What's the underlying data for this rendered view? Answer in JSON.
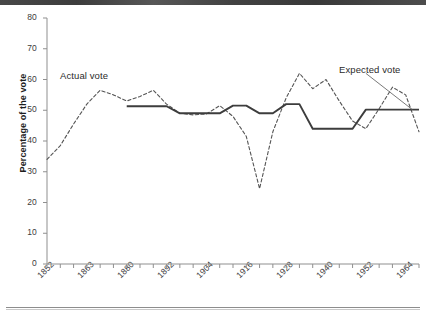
{
  "chart_data": {
    "type": "line",
    "title": "",
    "subtitle": "",
    "xlabel": "",
    "ylabel": "Percentage of the vote",
    "xlim": [
      1852,
      1964
    ],
    "ylim": [
      0,
      80
    ],
    "grid": false,
    "legend_position": "inline-annotation",
    "y_ticks": [
      0,
      10,
      20,
      30,
      40,
      50,
      60,
      70,
      80
    ],
    "y_tick_labels": [
      "0",
      "10",
      "20",
      "30",
      "40",
      "50",
      "60",
      "70",
      "80"
    ],
    "x_tick_step_years": 4,
    "x_label_step_years": 12,
    "x_ticks": [
      1852,
      1856,
      1860,
      1864,
      1868,
      1872,
      1876,
      1880,
      1884,
      1888,
      1892,
      1896,
      1900,
      1904,
      1908,
      1912,
      1916,
      1920,
      1924,
      1928,
      1932,
      1936,
      1940,
      1944,
      1948,
      1952,
      1956,
      1960,
      1964
    ],
    "x_tick_labels": [
      "1852",
      "1864",
      "1876",
      "1888",
      "1900",
      "1912",
      "1924",
      "1936",
      "1948",
      "1960"
    ],
    "x_labels_shown": [
      "1852",
      "1863",
      "1880",
      "1892",
      "1904",
      "1916",
      "1928",
      "1940",
      "1952",
      "1964"
    ],
    "annotations": [
      {
        "name": "actual-vote-label",
        "text": "Actual vote",
        "x": 1856,
        "y": 62
      },
      {
        "name": "expected-vote-label",
        "text": "Expected vote",
        "x": 1948,
        "y": 64
      }
    ],
    "series": [
      {
        "name": "Actual vote",
        "style": "dashed",
        "color": "#555555",
        "x": [
          1852,
          1856,
          1860,
          1864,
          1868,
          1872,
          1876,
          1880,
          1884,
          1888,
          1892,
          1896,
          1900,
          1904,
          1908,
          1912,
          1916,
          1920,
          1924,
          1928,
          1932,
          1936,
          1940,
          1944,
          1948,
          1952,
          1956,
          1960,
          1964
        ],
        "values": [
          34.0,
          38.5,
          45.5,
          52.0,
          56.5,
          55.0,
          53.0,
          54.5,
          56.5,
          52.0,
          49.0,
          48.5,
          48.8,
          51.5,
          48.0,
          41.5,
          24.5,
          43.0,
          54.0,
          62.0,
          57.0,
          60.0,
          53.0,
          46.5,
          44.0,
          50.5,
          57.5,
          55.0,
          43.0
        ]
      },
      {
        "name": "Expected vote",
        "style": "solid",
        "color": "#3d3d3d",
        "x": [
          1876,
          1880,
          1884,
          1888,
          1892,
          1896,
          1900,
          1904,
          1908,
          1912,
          1916,
          1920,
          1924,
          1928,
          1932,
          1936,
          1940,
          1944,
          1948,
          1952,
          1956,
          1960,
          1964
        ],
        "values": [
          51.3,
          51.3,
          51.3,
          51.3,
          49.0,
          49.0,
          49.0,
          49.0,
          51.5,
          51.5,
          49.0,
          49.0,
          52.0,
          52.0,
          44.0,
          44.0,
          44.0,
          44.0,
          50.2,
          50.2,
          50.2,
          50.2,
          50.2
        ]
      }
    ]
  },
  "leader_line": {
    "name": "expected-vote-leader",
    "from_x": 1948,
    "from_y": 62,
    "to_x": 1962,
    "to_y": 50.2
  }
}
